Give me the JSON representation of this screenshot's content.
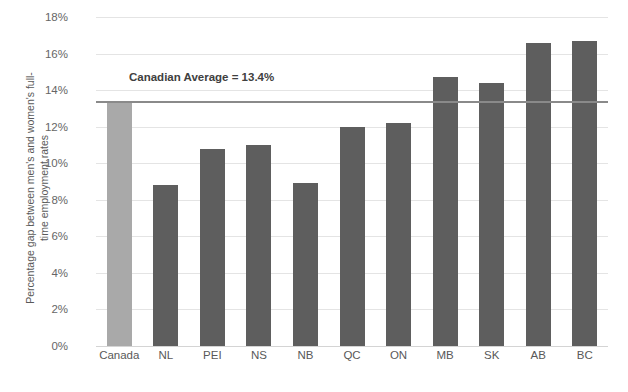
{
  "chart_data": {
    "type": "bar",
    "title": "",
    "xlabel": "",
    "ylabel": "Percentage gap between men's and women's full-time employment rates",
    "ylabel_line1": "Percentage gap between men's and women's full-",
    "ylabel_line2": "time employment rates",
    "categories": [
      "Canada",
      "NL",
      "PEI",
      "NS",
      "NB",
      "QC",
      "ON",
      "MB",
      "SK",
      "AB",
      "BC"
    ],
    "values": [
      13.4,
      8.8,
      10.8,
      11.0,
      8.9,
      12.0,
      12.2,
      14.7,
      14.4,
      16.6,
      16.7
    ],
    "ylim": [
      0,
      18
    ],
    "y_ticks": [
      0,
      2,
      4,
      6,
      8,
      10,
      12,
      14,
      16,
      18
    ],
    "y_tick_labels": [
      "0%",
      "2%",
      "4%",
      "6%",
      "8%",
      "10%",
      "12%",
      "14%",
      "16%",
      "18%"
    ],
    "grid": true,
    "legend": "none",
    "annotations": [
      {
        "text": "Canadian Average = 13.4%",
        "value": 13.4,
        "type": "reference-line-label"
      }
    ],
    "reference_line": {
      "label": "Canadian Average = 13.4%",
      "value": 13.4,
      "color": "#8a8a8a"
    },
    "colors": {
      "bar_default": "#5e5e5e",
      "bar_highlight": "#a9a9a9",
      "gridline": "#e4e4e4",
      "reference_line": "#8a8a8a",
      "text": "#595959",
      "background": "#ffffff"
    },
    "highlight_category": "Canada"
  }
}
